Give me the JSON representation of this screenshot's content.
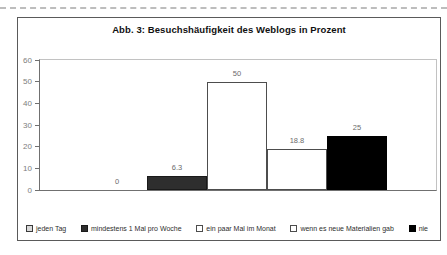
{
  "chart": {
    "title": "Abb. 3: Besuchshäufigkeit des Weblogs in Prozent"
  },
  "chart_data": {
    "type": "bar",
    "title": "Abb. 3: Besuchshäufigkeit des Weblogs in Prozent",
    "categories": [
      "jeden Tag",
      "mindestens 1 Mal pro Woche",
      "ein paar Mal im Monat",
      "wenn es neue Materialien gab",
      "nie"
    ],
    "values": [
      0,
      6.3,
      50,
      18.8,
      25
    ],
    "value_labels": [
      "0",
      "6.3",
      "50",
      "18.8",
      "25"
    ],
    "bar_colors": [
      "#d9d9d9",
      "#2e2e2e",
      "#ffffff",
      "#ffffff",
      "#000000"
    ],
    "bar_borders": [
      "#3a3a3a",
      "#1a1a1a",
      "#4d4d4d",
      "#4d4d4d",
      "#000000"
    ],
    "xlabel": "",
    "ylabel": "",
    "ylim": [
      0,
      60
    ],
    "yticks": [
      0,
      10,
      20,
      30,
      40,
      50,
      60
    ],
    "bar_gap": 0,
    "grid": false,
    "legend_position": "bottom"
  }
}
